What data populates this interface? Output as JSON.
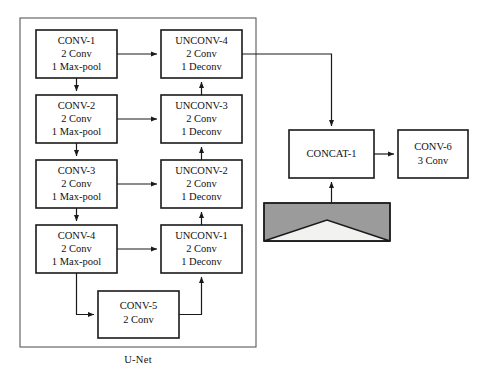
{
  "figure": {
    "kind": "architecture-block-diagram",
    "title_label": "U-Net",
    "background_color": "#ffffff",
    "line_color": "#1a1a1a",
    "group_border_color": "#5a5a5a"
  },
  "groups": [
    {
      "id": "unet-group",
      "label": "U-Net",
      "x": 20,
      "y": 18,
      "width": 236,
      "height": 329,
      "label_x": 138,
      "label_y": 361
    }
  ],
  "blocks": [
    {
      "id": "conv-1",
      "name": "conv-1-block",
      "x": 36,
      "y": 30,
      "width": 81,
      "height": 48,
      "lines": [
        "CONV-1",
        "2 Conv",
        "1 Max-pool"
      ]
    },
    {
      "id": "conv-2",
      "name": "conv-2-block",
      "x": 36,
      "y": 95,
      "width": 81,
      "height": 48,
      "lines": [
        "CONV-2",
        "2 Conv",
        "1 Max-pool"
      ]
    },
    {
      "id": "conv-3",
      "name": "conv-3-block",
      "x": 36,
      "y": 160,
      "width": 81,
      "height": 48,
      "lines": [
        "CONV-3",
        "2 Conv",
        "1 Max-pool"
      ]
    },
    {
      "id": "conv-4",
      "name": "conv-4-block",
      "x": 36,
      "y": 225,
      "width": 81,
      "height": 48,
      "lines": [
        "CONV-4",
        "2 Conv",
        "1 Max-pool"
      ]
    },
    {
      "id": "conv-5",
      "name": "conv-5-block",
      "x": 98,
      "y": 291,
      "width": 81,
      "height": 47,
      "lines": [
        "CONV-5",
        "2 Conv"
      ]
    },
    {
      "id": "unconv-4",
      "name": "unconv-4-block",
      "x": 161,
      "y": 30,
      "width": 81,
      "height": 48,
      "lines": [
        "UNCONV-4",
        "2 Conv",
        "1 Deconv"
      ]
    },
    {
      "id": "unconv-3",
      "name": "unconv-3-block",
      "x": 161,
      "y": 95,
      "width": 81,
      "height": 48,
      "lines": [
        "UNCONV-3",
        "2 Conv",
        "1 Deconv"
      ]
    },
    {
      "id": "unconv-2",
      "name": "unconv-2-block",
      "x": 161,
      "y": 160,
      "width": 81,
      "height": 48,
      "lines": [
        "UNCONV-2",
        "2 Conv",
        "1 Deconv"
      ]
    },
    {
      "id": "unconv-1",
      "name": "unconv-1-block",
      "x": 161,
      "y": 225,
      "width": 81,
      "height": 48,
      "lines": [
        "UNCONV-1",
        "2 Conv",
        "1 Deconv"
      ]
    },
    {
      "id": "concat-1",
      "name": "concat-1-block",
      "x": 289,
      "y": 130,
      "width": 85,
      "height": 48,
      "lines": [
        "CONCAT-1"
      ]
    },
    {
      "id": "conv-6",
      "name": "conv-6-block",
      "x": 398,
      "y": 130,
      "width": 70,
      "height": 48,
      "lines": [
        "CONV-6",
        "3 Conv"
      ]
    }
  ],
  "image_thumbnail": {
    "name": "input-image-thumbnail",
    "x": 264,
    "y": 203,
    "width": 126,
    "height": 38,
    "fill_color": "#9b9b9b",
    "triangle_color": "#f2f2f0",
    "description": "gray image tile with light triangle"
  },
  "connections": [
    {
      "id": "c1-to-c2",
      "from": "conv-1",
      "to": "conv-2",
      "kind": "down-arrow"
    },
    {
      "id": "c2-to-c3",
      "from": "conv-2",
      "to": "conv-3",
      "kind": "down-arrow"
    },
    {
      "id": "c3-to-c4",
      "from": "conv-3",
      "to": "conv-4",
      "kind": "down-arrow"
    },
    {
      "id": "c4-to-c5",
      "from": "conv-4",
      "to": "conv-5",
      "kind": "down-right-arrow"
    },
    {
      "id": "c5-to-u1",
      "from": "conv-5",
      "to": "unconv-1",
      "kind": "right-up-arrow"
    },
    {
      "id": "u1-to-u2",
      "from": "unconv-1",
      "to": "unconv-2",
      "kind": "up-arrow"
    },
    {
      "id": "u2-to-u3",
      "from": "unconv-2",
      "to": "unconv-3",
      "kind": "up-arrow"
    },
    {
      "id": "u3-to-u4",
      "from": "unconv-3",
      "to": "unconv-4",
      "kind": "up-arrow"
    },
    {
      "id": "skip-c1-u4",
      "from": "conv-1",
      "to": "unconv-4",
      "kind": "skip-right-arrow"
    },
    {
      "id": "skip-c2-u3",
      "from": "conv-2",
      "to": "unconv-3",
      "kind": "skip-right-arrow"
    },
    {
      "id": "skip-c3-u2",
      "from": "conv-3",
      "to": "unconv-2",
      "kind": "skip-right-arrow"
    },
    {
      "id": "skip-c4-u1",
      "from": "conv-4",
      "to": "unconv-1",
      "kind": "skip-right-arrow"
    },
    {
      "id": "u4-to-concat",
      "from": "unconv-4",
      "to": "concat-1",
      "kind": "right-down-arrow"
    },
    {
      "id": "image-to-concat",
      "from": "image_thumbnail",
      "to": "concat-1",
      "kind": "up-arrow"
    },
    {
      "id": "concat-to-conv6",
      "from": "concat-1",
      "to": "conv-6",
      "kind": "right-arrow"
    }
  ]
}
